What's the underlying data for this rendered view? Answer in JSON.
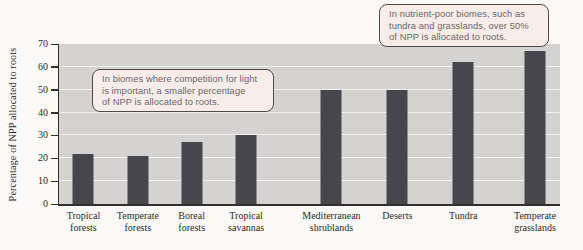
{
  "chart_data": {
    "type": "bar",
    "categories": [
      "Tropical forests",
      "Temperate forests",
      "Boreal forests",
      "Tropical savannas",
      "Mediterranean shrublands",
      "Deserts",
      "Tundra",
      "Temperate grasslands"
    ],
    "values": [
      22,
      21,
      27,
      30,
      50,
      50,
      62,
      67
    ],
    "category_label_lines": [
      [
        "Tropical",
        "forests"
      ],
      [
        "Temperate",
        "forests"
      ],
      [
        "Boreal",
        "forests"
      ],
      [
        "Tropical",
        "savannas"
      ],
      [
        "Mediterranean",
        "shrublands"
      ],
      [
        "Deserts"
      ],
      [
        "Tundra"
      ],
      [
        "Temperate",
        "grasslands"
      ]
    ],
    "ylabel": "Percentage of NPP allocated to roots",
    "ylim": [
      0,
      70
    ],
    "yticks": [
      0,
      10,
      20,
      30,
      40,
      50,
      60,
      70
    ],
    "grid": true,
    "legend": false,
    "bar_color": "#46464c",
    "plot_bg_color": "#d4d3d1",
    "gridline_color": "#f2f1ee",
    "x_centers_pct": [
      4.88,
      15.74,
      26.49,
      37.35,
      54.38,
      67.53,
      80.68,
      95.02
    ]
  },
  "annotations": [
    {
      "lines": [
        "In biomes where competition for light",
        "is important, a smaller percentage",
        "of NPP is allocated to roots."
      ]
    },
    {
      "lines": [
        "In nutrient-poor biomes, such as",
        "tundra and grasslands, over 50%",
        "of NPP is allocated to roots."
      ]
    }
  ],
  "annotation_style": {
    "bg": "#f9edea",
    "border": "#4b4b4b",
    "text": "#67676a"
  }
}
